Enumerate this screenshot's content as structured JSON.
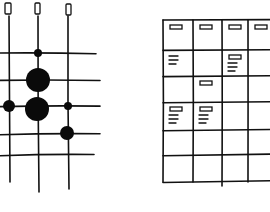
{
  "sketch": {
    "description": "Hand-drawn wireframe: dot-matrix grid (left) and calendar/card grid (right)",
    "ink_color": "#111111",
    "background": "#ffffff"
  },
  "dot_matrix": {
    "columns": [
      {
        "x": 9,
        "top": 16,
        "bottom": 182,
        "handle": {
          "x": 5,
          "y": 3,
          "w": 6,
          "h": 11
        }
      },
      {
        "x": 38,
        "top": 16,
        "bottom": 192,
        "handle": {
          "x": 35,
          "y": 3,
          "w": 5,
          "h": 11
        }
      },
      {
        "x": 68,
        "top": 16,
        "bottom": 189,
        "handle": {
          "x": 66,
          "y": 4,
          "w": 5,
          "h": 11
        }
      }
    ],
    "rows": [
      {
        "y": 53,
        "x1": 0,
        "x2": 96
      },
      {
        "y": 80,
        "x1": 0,
        "x2": 100
      },
      {
        "y": 106,
        "x1": 0,
        "x2": 100
      },
      {
        "y": 134,
        "x1": 0,
        "x2": 100
      },
      {
        "y": 155,
        "x1": 0,
        "x2": 94
      }
    ],
    "dots": [
      {
        "cx": 38,
        "cy": 53,
        "r": 4
      },
      {
        "cx": 38,
        "cy": 80,
        "r": 12
      },
      {
        "cx": 9,
        "cy": 106,
        "r": 6
      },
      {
        "cx": 37,
        "cy": 109,
        "r": 12
      },
      {
        "cx": 68,
        "cy": 106,
        "r": 4
      },
      {
        "cx": 67,
        "cy": 133,
        "r": 7
      }
    ]
  },
  "card_grid": {
    "col_x": [
      163,
      193,
      222,
      248,
      270
    ],
    "row_y": [
      20,
      50,
      76,
      102,
      130,
      155,
      182
    ],
    "cells": [
      {
        "row": 0,
        "col": 0,
        "tag": true,
        "lines": 0
      },
      {
        "row": 0,
        "col": 1,
        "tag": true,
        "lines": 0
      },
      {
        "row": 0,
        "col": 2,
        "tag": true,
        "lines": 0
      },
      {
        "row": 0,
        "col": 3,
        "tag": true,
        "lines": 0
      },
      {
        "row": 1,
        "col": 0,
        "tag": false,
        "lines": 3
      },
      {
        "row": 1,
        "col": 2,
        "tag": true,
        "lines": 3
      },
      {
        "row": 2,
        "col": 1,
        "tag": true,
        "lines": 0
      },
      {
        "row": 3,
        "col": 0,
        "tag": true,
        "lines": 3
      },
      {
        "row": 3,
        "col": 1,
        "tag": true,
        "lines": 3
      }
    ]
  }
}
